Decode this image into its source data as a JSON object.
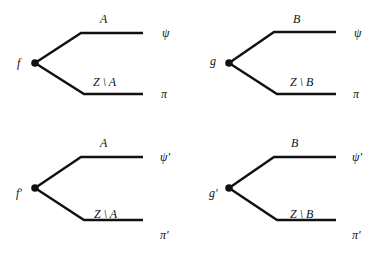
{
  "diagram": {
    "type": "tree-pairs",
    "trees": [
      {
        "id": "f",
        "root_label": "f",
        "upper_edge_label": "A",
        "lower_edge_label": "Z \\ A",
        "upper_leaf": "ψ",
        "lower_leaf": "π"
      },
      {
        "id": "g",
        "root_label": "g",
        "upper_edge_label": "B",
        "lower_edge_label": "Z \\ B",
        "upper_leaf": "ψ",
        "lower_leaf": "π"
      },
      {
        "id": "f-prime",
        "root_label": "f'",
        "upper_edge_label": "A",
        "lower_edge_label": "Z \\ A",
        "upper_leaf": "ψ'",
        "lower_leaf": "π'"
      },
      {
        "id": "g-prime",
        "root_label": "g'",
        "upper_edge_label": "B",
        "lower_edge_label": "Z \\ B",
        "upper_leaf": "ψ'",
        "lower_leaf": "π'"
      }
    ]
  }
}
